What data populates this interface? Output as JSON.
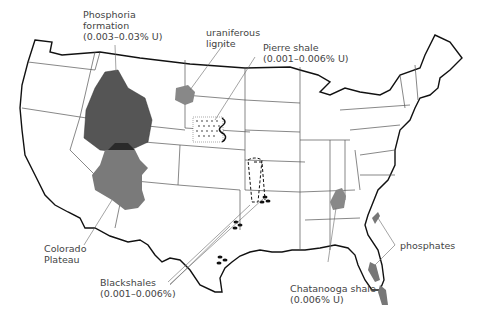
{
  "map": {
    "title": "Uranium-bearing deposits of the United States",
    "labels": {
      "phosphoria": {
        "line1": "Phosphoria",
        "line2": "formation",
        "line3": "(0.003–0.03% U)"
      },
      "lignite": {
        "line1": "uraniferous",
        "line2": "lignite"
      },
      "pierre": {
        "line1": "Pierre shale",
        "line2": "(0.001–0.006% U)"
      },
      "colorado": {
        "line1": "Colorado",
        "line2": "Plateau"
      },
      "blackshales": {
        "line1": "Blackshales",
        "line2": "(0.001–0.006%)"
      },
      "chattanooga": {
        "line1": "Chatanooga shale",
        "line2": "(0.006% U)"
      },
      "phosphates": {
        "line1": "phosphates"
      }
    },
    "colors": {
      "outline": "#111111",
      "state_lines": "#555555",
      "phosphoria_fill": "#555555",
      "colorado_fill": "#7a7a7a",
      "overlap_fill": "#2a2a2a",
      "lignite_fill": "#888888",
      "chattanooga_fill": "#888888",
      "text": "#444444"
    }
  }
}
